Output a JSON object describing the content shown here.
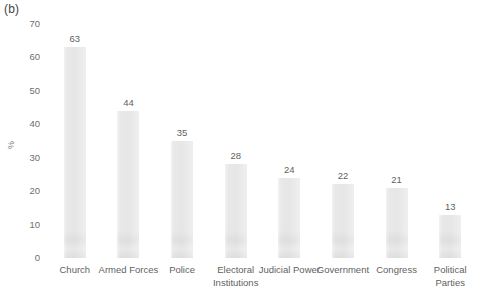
{
  "panel": {
    "label": "(b)"
  },
  "chart_data": {
    "type": "bar",
    "title": "",
    "subtitle": "",
    "xlabel": "",
    "ylabel": "%",
    "categories": [
      "Church",
      "Armed Forces",
      "Police",
      "Electoral Institutions",
      "Judicial Power",
      "Government",
      "Congress",
      "Political Parties"
    ],
    "values": [
      63,
      44,
      35,
      28,
      24,
      22,
      21,
      13
    ],
    "value_labels": [
      "63",
      "44",
      "35",
      "28",
      "24",
      "22",
      "21",
      "13"
    ],
    "ylim": [
      0,
      70
    ],
    "ytick_labels": [
      "70",
      "60",
      "50",
      "40",
      "30",
      "20",
      "10",
      "0"
    ],
    "ytick_values": [
      70,
      60,
      50,
      40,
      30,
      20,
      10,
      0
    ],
    "grid": false,
    "legend": null,
    "bar_color": "#e3e3e3",
    "text_color": "#5f5f5f",
    "background": "#ffffff"
  }
}
